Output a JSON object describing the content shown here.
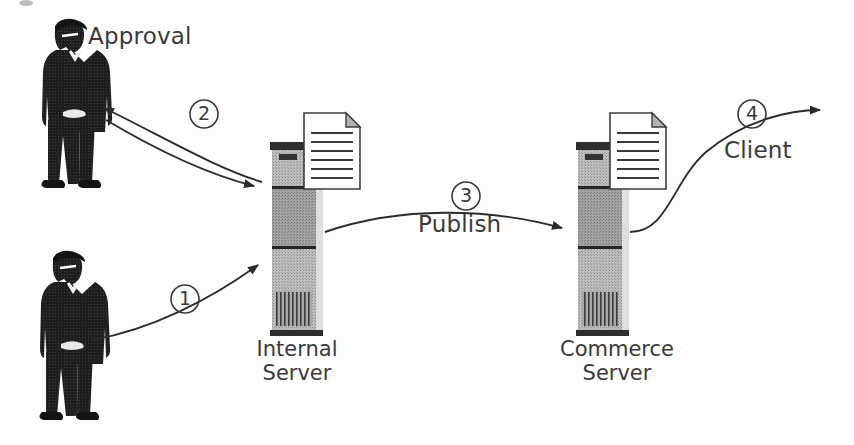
{
  "diagram": {
    "background_color": "#fdfdfd",
    "ink_color": "#2b2b2b",
    "nodes": [
      {
        "id": "author",
        "type": "person-icon",
        "label": "",
        "x": 18,
        "y": 248,
        "w": 96,
        "h": 178
      },
      {
        "id": "approver",
        "type": "person-icon",
        "label": "Approval",
        "label_x": 88,
        "label_y": 24,
        "x": 20,
        "y": 16,
        "w": 96,
        "h": 178
      },
      {
        "id": "internal-server",
        "type": "server-tower-icon",
        "label_line1": "Internal",
        "label_line2": "Server",
        "x": 272,
        "y": 140,
        "w": 52,
        "h": 196,
        "has_document": true
      },
      {
        "id": "commerce-server",
        "type": "server-tower-icon",
        "label_line1": "Commerce",
        "label_line2": "Server",
        "x": 578,
        "y": 140,
        "w": 52,
        "h": 196,
        "has_document": true
      }
    ],
    "arrows": [
      {
        "id": "arrow-1",
        "number": "1",
        "label": "",
        "from": "author",
        "to": "internal-server",
        "number_x": 171,
        "number_y": 289
      },
      {
        "id": "arrow-2-to-approver",
        "number": "2",
        "label": "",
        "from": "internal-server",
        "to": "approver",
        "number_x": 190,
        "number_y": 104
      },
      {
        "id": "arrow-2-to-server",
        "number": "",
        "label": "",
        "from": "approver",
        "to": "internal-server",
        "number_x": 0,
        "number_y": 0
      },
      {
        "id": "arrow-3",
        "number": "3",
        "label": "Publish",
        "from": "internal-server",
        "to": "commerce-server",
        "number_x": 452,
        "number_y": 186
      },
      {
        "id": "arrow-4",
        "number": "4",
        "label": "Client",
        "from": "commerce-server",
        "to": "client-edge",
        "number_x": 738,
        "number_y": 104
      }
    ],
    "labels": {
      "approval": "Approval",
      "publish": "Publish",
      "client": "Client",
      "internal_line1": "Internal",
      "internal_line2": "Server",
      "commerce_line1": "Commerce",
      "commerce_line2": "Server"
    },
    "numbers": {
      "one": "1",
      "two": "2",
      "three": "3",
      "four": "4"
    },
    "colors": {
      "server_body_light": "#b9b9b9",
      "server_body_mid": "#9a9a9a",
      "server_body_dark": "#8a8a8a",
      "server_bar": "#2e2e2e",
      "server_edge_highlight": "#dcdcdc",
      "document_fill": "#ffffff",
      "document_line": "#3a3a3a",
      "person_fill": "#222222",
      "person_shirt": "#ffffff",
      "stroke": "#2b2b2b"
    }
  }
}
